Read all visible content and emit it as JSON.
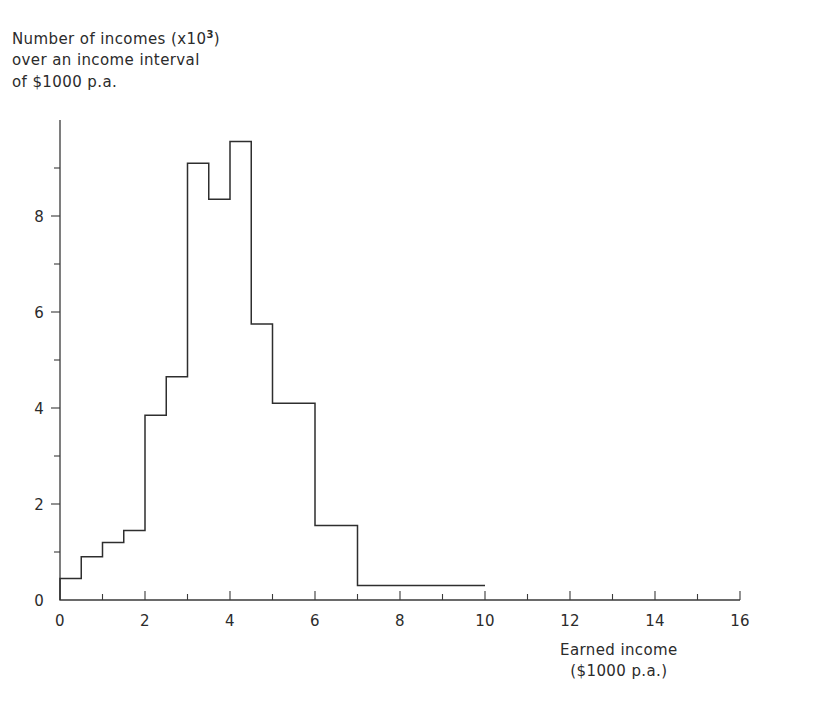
{
  "chart_data": {
    "type": "bar",
    "title": "",
    "ylabel_lines": [
      "Number of incomes (x10",
      "over an income interval",
      "of $1000 p.a."
    ],
    "ylabel_exponent": "3",
    "ylabel_close": ")",
    "xlabel_lines": [
      "Earned income",
      "($1000 p.a.)"
    ],
    "xlim": [
      0,
      16
    ],
    "ylim": [
      0,
      10
    ],
    "grid": false,
    "legend": null,
    "xticks": [
      0,
      2,
      4,
      6,
      8,
      10,
      12,
      14,
      16
    ],
    "xticklabels": [
      "0",
      "2",
      "4",
      "6",
      "8",
      "10",
      "12",
      "14",
      "16"
    ],
    "xminorticks": [
      1,
      3,
      5,
      7,
      9,
      11,
      13,
      15
    ],
    "yticks": [
      0,
      2,
      4,
      6,
      8
    ],
    "yticklabels": [
      "0",
      "2",
      "4",
      "6",
      "8"
    ],
    "yminorticks": [
      1,
      3,
      5,
      7,
      9
    ],
    "bin_edges": [
      0,
      0.5,
      1,
      1.5,
      2,
      2.5,
      3,
      3.5,
      4,
      4.5,
      5,
      6,
      7,
      10
    ],
    "values": [
      0.45,
      0.9,
      1.2,
      1.45,
      3.85,
      4.65,
      9.1,
      8.35,
      9.55,
      5.75,
      4.1,
      1.55,
      0.3
    ],
    "line_color": "#2e2e2e",
    "axis_color": "#3a3a3a",
    "background": "#ffffff"
  },
  "figure": {
    "name": "income-distribution-histogram"
  }
}
